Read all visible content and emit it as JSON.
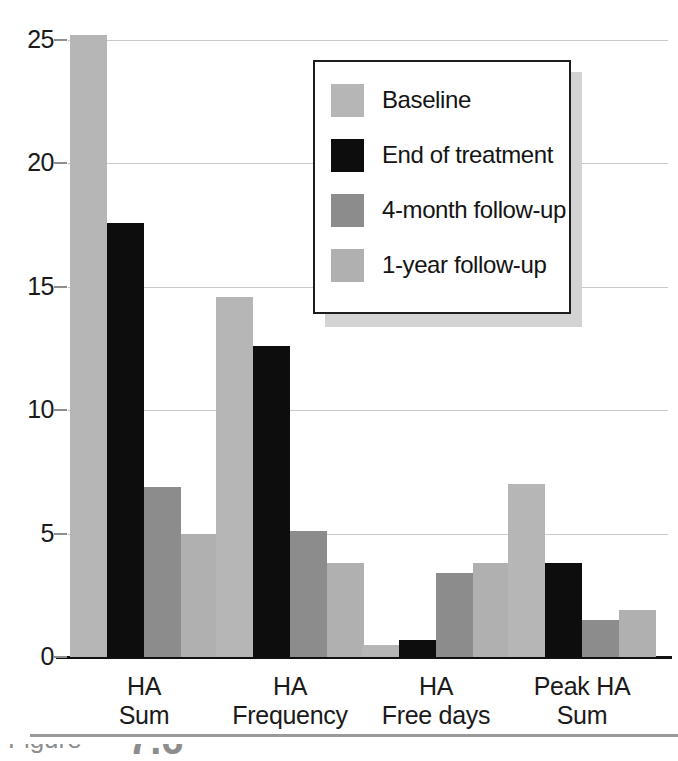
{
  "figure": {
    "caption_prefix": "Figure",
    "caption_number": "7.6"
  },
  "chart_data": {
    "type": "bar",
    "title": "",
    "subtitle": "",
    "xlabel": "",
    "ylabel": "",
    "grid": true,
    "legend_position": "upper-right-inside",
    "ylim": [
      0,
      25
    ],
    "yticks": [
      0,
      5,
      10,
      15,
      20,
      25
    ],
    "ytick_labels": [
      "0",
      "5",
      "10",
      "15",
      "20",
      "25"
    ],
    "categories": [
      "HA Sum",
      "HA Frequency",
      "HA Free days",
      "Peak HA Sum"
    ],
    "category_lines": [
      [
        "HA",
        "Sum"
      ],
      [
        "HA",
        "Frequency"
      ],
      [
        "HA",
        "Free days"
      ],
      [
        "Peak HA",
        "Sum"
      ]
    ],
    "series": [
      {
        "name": "Baseline",
        "color": "#b6b6b6",
        "values": [
          25.2,
          14.6,
          0.5,
          7.0
        ]
      },
      {
        "name": "End of treatment",
        "color": "#0d0d0d",
        "values": [
          17.6,
          12.6,
          0.7,
          3.8
        ]
      },
      {
        "name": "4-month follow-up",
        "color": "#8c8c8c",
        "values": [
          6.9,
          5.1,
          3.4,
          1.5
        ]
      },
      {
        "name": "1-year follow-up",
        "color": "#b0b0b0",
        "values": [
          5.0,
          3.8,
          3.8,
          1.9
        ]
      }
    ]
  },
  "legend": {
    "items": [
      {
        "label": "Baseline",
        "swatch": "#b6b6b6"
      },
      {
        "label": "End of treatment",
        "swatch": "#0d0d0d"
      },
      {
        "label": "4-month follow-up",
        "swatch": "#8c8c8c"
      },
      {
        "label": "1-year follow-up",
        "swatch": "#b0b0b0"
      }
    ]
  }
}
